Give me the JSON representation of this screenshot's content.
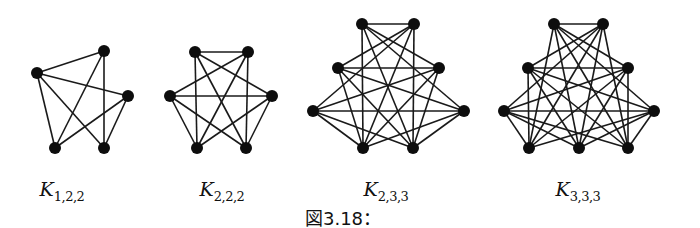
{
  "caption": "図3.18：",
  "colors": {
    "edge": "#1a1a1a",
    "node": "#0d0d0d",
    "background": "#ffffff"
  },
  "graphs": [
    {
      "name": "K_{1,2,2}",
      "label_main": "K",
      "label_sub": "1,2,2",
      "label_x": 62,
      "node_radius": 6,
      "nodes": {
        "L": [
          37,
          73
        ],
        "T": [
          104,
          51
        ],
        "R": [
          128,
          96
        ],
        "BL": [
          55,
          148
        ],
        "BR": [
          104,
          148
        ]
      },
      "parts": [
        [
          "L"
        ],
        [
          "T",
          "R"
        ],
        [
          "BL",
          "BR"
        ]
      ]
    },
    {
      "name": "K_{2,2,2}",
      "label_main": "K",
      "label_sub": "2,2,2",
      "label_x": 222,
      "node_radius": 6,
      "nodes": {
        "TL": [
          195,
          52
        ],
        "TR": [
          248,
          52
        ],
        "ML": [
          170,
          96
        ],
        "MR": [
          272,
          96
        ],
        "BL": [
          197,
          148
        ],
        "BR": [
          246,
          148
        ]
      },
      "parts": [
        [
          "TL",
          "ML"
        ],
        [
          "TR",
          "MR"
        ],
        [
          "BL",
          "BR"
        ]
      ]
    },
    {
      "name": "K_{2,3,3}",
      "label_main": "K",
      "label_sub": "2,3,3",
      "label_x": 386,
      "node_radius": 6,
      "nodes": {
        "TL": [
          362,
          24
        ],
        "TR": [
          414,
          24
        ],
        "ML": [
          338,
          68
        ],
        "MR": [
          439,
          68
        ],
        "OL": [
          313,
          111
        ],
        "OR": [
          464,
          111
        ],
        "BL": [
          363,
          148
        ],
        "BR": [
          413,
          148
        ]
      },
      "parts": [
        [
          "TL",
          "ML",
          "OL"
        ],
        [
          "TR",
          "MR",
          "OR"
        ],
        [
          "BL",
          "BR"
        ]
      ]
    },
    {
      "name": "K_{3,3,3}",
      "label_main": "K",
      "label_sub": "3,3,3",
      "label_x": 578,
      "node_radius": 6,
      "nodes": {
        "TL": [
          554,
          24
        ],
        "TR": [
          603,
          24
        ],
        "ML": [
          528,
          68
        ],
        "MR": [
          628,
          68
        ],
        "OL": [
          504,
          111
        ],
        "OR": [
          654,
          111
        ],
        "BL": [
          529,
          148
        ],
        "BM": [
          579,
          148
        ],
        "BR": [
          628,
          148
        ]
      },
      "parts": [
        [
          "TL",
          "ML",
          "OL"
        ],
        [
          "TR",
          "MR",
          "OR"
        ],
        [
          "BL",
          "BM",
          "BR"
        ]
      ]
    }
  ]
}
